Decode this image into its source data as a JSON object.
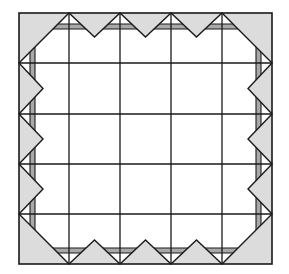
{
  "diagram": {
    "colors": {
      "background": "#ffffff",
      "light_fill": "#dcdcdc",
      "band_fill": "#a9a9a9",
      "stroke": "#1a1a1a"
    },
    "frame": {
      "x0": 19,
      "y0": 13,
      "x1": 272,
      "y1": 264
    },
    "grid": {
      "xs": [
        19,
        69,
        120,
        171,
        222,
        272
      ],
      "ys": [
        13,
        63,
        114,
        164,
        214,
        264
      ]
    },
    "band": {
      "inner_offset": 11,
      "outer_offset": 16
    },
    "notch_depth": 24
  }
}
